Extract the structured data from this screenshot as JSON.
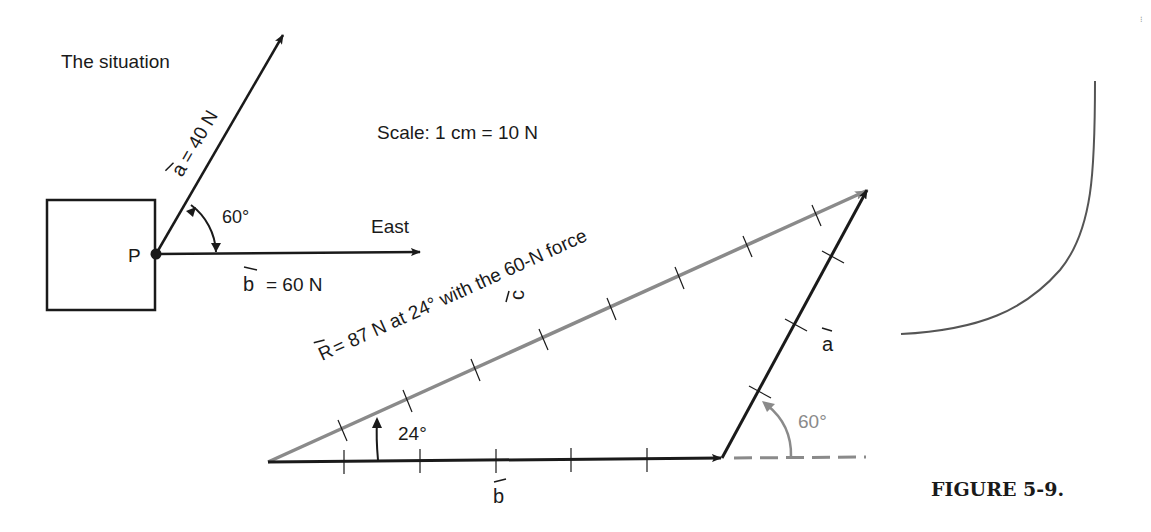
{
  "situation": {
    "title": "The situation",
    "point_label": "P",
    "vector_a_label": "a = 40 N",
    "vector_a_symbol": "a",
    "vector_a_value": "= 40 N",
    "vector_b_symbol": "b",
    "vector_b_value": "= 60 N",
    "angle_label": "60°",
    "direction_label": "East"
  },
  "scale": {
    "text": "Scale: 1 cm = 10 N"
  },
  "triangle": {
    "resultant_label": "R = 87 N at 24° with the 60-N force",
    "resultant_symbol": "R",
    "resultant_text": "= 87 N at 24° with the 60-N force",
    "vector_c_symbol": "c",
    "vector_a_symbol": "a",
    "vector_b_symbol": "b",
    "angle_24_label": "24°",
    "angle_60_label": "60°"
  },
  "caption": {
    "text": "FIGURE 5-9."
  },
  "colors": {
    "ink": "#1a1a1a",
    "resultant_gray": "#8a8a8a"
  }
}
